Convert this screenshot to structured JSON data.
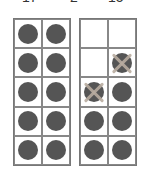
{
  "equation": {
    "a": "17",
    "op": "−",
    "b": "2",
    "eq": "=",
    "result": "15"
  },
  "colors": {
    "dot": "#555555",
    "cross": "#b8aca0",
    "border": "#777777"
  },
  "frames": [
    {
      "name": "left-ten-frame",
      "cells": [
        "dot",
        "dot",
        "dot",
        "dot",
        "dot",
        "dot",
        "dot",
        "dot",
        "dot",
        "dot"
      ]
    },
    {
      "name": "right-ten-frame",
      "cells": [
        "empty",
        "empty",
        "empty",
        "crossed",
        "crossed",
        "dot",
        "dot",
        "dot",
        "dot",
        "dot"
      ]
    }
  ]
}
